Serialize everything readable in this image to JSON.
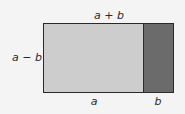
{
  "diagram": {
    "title": "",
    "labels": {
      "top": "a + b",
      "left": "a − b",
      "bottom_light": "a",
      "bottom_dark": "b"
    },
    "regions": [
      {
        "name": "light-rectangle",
        "width_label": "a",
        "height_label": "a − b",
        "fill": "#cdcdcd"
      },
      {
        "name": "dark-rectangle",
        "width_label": "b",
        "height_label": "a − b",
        "fill": "#6b6b6b"
      }
    ],
    "colors": {
      "background": "#f4f4f4",
      "border": "#2a2a2a",
      "light_fill": "#cdcdcd",
      "dark_fill": "#6b6b6b"
    }
  }
}
